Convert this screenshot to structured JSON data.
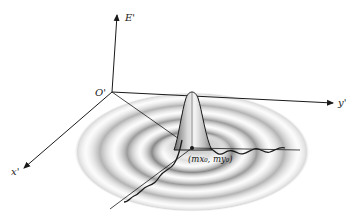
{
  "diagram": {
    "title": "",
    "axes": {
      "vertical": {
        "label": "E'"
      },
      "y": {
        "label": "y'"
      },
      "x": {
        "label": "x'"
      },
      "origin": {
        "label": "O'"
      }
    },
    "peak": {
      "center_label": "(mx₀, my₀)"
    },
    "pattern": {
      "kind": "central peak with concentric diffraction rings",
      "ring_count": 4
    },
    "colors": {
      "ink": "#1a1a1a",
      "ring_shade": "#8a8a8a",
      "background": "#ffffff"
    }
  }
}
